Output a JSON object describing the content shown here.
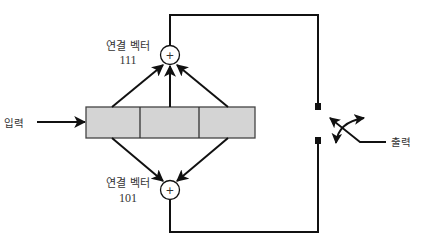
{
  "diagram": {
    "type": "convolutional-encoder",
    "colors": {
      "line": "#111111",
      "register_fill": "#d4d4d4",
      "register_stroke": "#444444",
      "text": "#333333",
      "background": "#ffffff"
    },
    "input": {
      "label": "입력"
    },
    "output": {
      "label": "출력"
    },
    "register": {
      "cells": 3
    },
    "adders": [
      {
        "id": "top",
        "symbol": "+",
        "label": "연결 벡터",
        "vector": "111",
        "taps": [
          1,
          1,
          1
        ]
      },
      {
        "id": "bottom",
        "symbol": "+",
        "label": "연결 벡터",
        "vector": "101",
        "taps": [
          1,
          0,
          1
        ]
      }
    ],
    "switch": {
      "terminals": 2
    }
  }
}
